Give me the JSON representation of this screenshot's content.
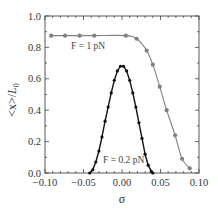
{
  "chart_data": {
    "type": "line",
    "title": "",
    "xlabel": "σ",
    "ylabel": "<x>/L0",
    "xlim": [
      -0.1,
      0.1
    ],
    "ylim": [
      0.0,
      1.0
    ],
    "xticks": [
      "-0.10",
      "-0.05",
      "0.00",
      "0.05",
      "0.10"
    ],
    "yticks": [
      "0.0",
      "0.2",
      "0.4",
      "0.6",
      "0.8",
      "1.0"
    ],
    "grid": false,
    "legend": null,
    "annotations": [
      "F = 1 pN",
      "F = 0.2 pN"
    ],
    "series": [
      {
        "name": "F = 1 pN",
        "color": "#808080",
        "x": [
          -0.092,
          -0.074,
          -0.055,
          -0.036,
          0.005,
          0.019,
          0.032,
          0.04,
          0.049,
          0.058,
          0.069,
          0.078,
          0.088
        ],
        "y": [
          0.875,
          0.875,
          0.875,
          0.875,
          0.875,
          0.855,
          0.78,
          0.69,
          0.55,
          0.4,
          0.24,
          0.09,
          0.03
        ]
      },
      {
        "name": "F = 0.2 pN",
        "color": "#111111",
        "x": [
          -0.042,
          -0.038,
          -0.034,
          -0.03,
          -0.026,
          -0.022,
          -0.018,
          -0.014,
          -0.01,
          -0.006,
          -0.002,
          0.002,
          0.006,
          0.01,
          0.014,
          0.018,
          0.022,
          0.026,
          0.03,
          0.034,
          0.038,
          0.04
        ],
        "y": [
          0.0,
          0.02,
          0.07,
          0.14,
          0.23,
          0.33,
          0.42,
          0.51,
          0.59,
          0.65,
          0.68,
          0.68,
          0.65,
          0.59,
          0.51,
          0.42,
          0.32,
          0.22,
          0.12,
          0.05,
          0.01,
          0.0
        ]
      }
    ]
  },
  "labels": {
    "xlabel": "σ",
    "ylabel_main": "<x>/",
    "ylabel_italic": "L",
    "ylabel_sub": "0",
    "annot_f1": "F = 1 pN",
    "annot_f02": "F = 0.2 pN"
  }
}
